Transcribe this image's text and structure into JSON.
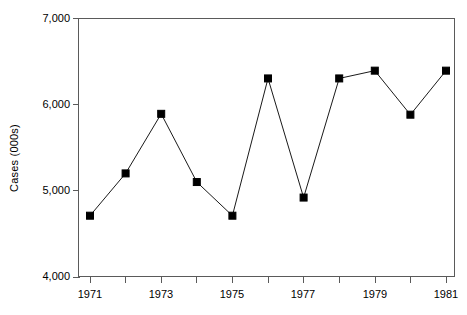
{
  "chart_data": {
    "type": "line",
    "title": "",
    "xlabel": "",
    "ylabel": "Cases (000s)",
    "x": [
      1971,
      1972,
      1973,
      1974,
      1975,
      1976,
      1977,
      1978,
      1979,
      1980,
      1981
    ],
    "values": [
      4710,
      5200,
      5890,
      5100,
      4710,
      6300,
      4920,
      6300,
      6390,
      5880,
      6390
    ],
    "series": [
      {
        "name": "Cases",
        "values": [
          4710,
          5200,
          5890,
          5100,
          4710,
          6300,
          4920,
          6300,
          6390,
          5880,
          6390
        ]
      }
    ],
    "xlim": [
      1970.6,
      1981.4
    ],
    "ylim": [
      4000,
      7000
    ],
    "y_ticks": [
      4000,
      5000,
      6000,
      7000
    ],
    "y_tick_labels": [
      "4,000",
      "5,000",
      "6,000",
      "7,000"
    ],
    "y_minor_tick_interval": 250,
    "x_ticks": [
      1971,
      1972,
      1973,
      1974,
      1975,
      1976,
      1977,
      1978,
      1979,
      1980,
      1981
    ],
    "x_tick_labels": [
      "1971",
      "",
      "1973",
      "",
      "1975",
      "",
      "1977",
      "",
      "1979",
      "",
      "1981"
    ],
    "x_labeled_ticks": [
      1971,
      1973,
      1975,
      1977,
      1979,
      1981
    ],
    "grid": false,
    "legend": null,
    "marker": "square",
    "marker_color": "#000000",
    "line_color": "#1a1a1a",
    "axis_color": "#5a5a5a",
    "background": "#ffffff"
  },
  "axes": {
    "y_title": "Cases (000s)",
    "y_labels": [
      "7,000",
      "6,000",
      "5,000",
      "4,000"
    ],
    "x_labels": [
      "1971",
      "1973",
      "1975",
      "1977",
      "1979",
      "1981"
    ]
  }
}
